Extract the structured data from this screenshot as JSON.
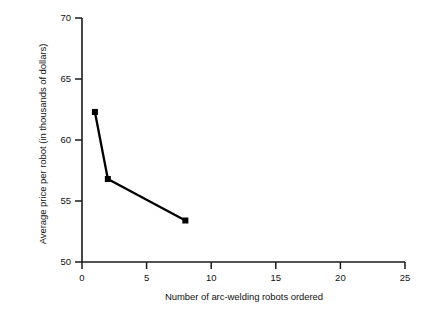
{
  "chart_data": {
    "type": "line",
    "title": "",
    "subtitle": "",
    "xlabel": "Number of arc-welding robots ordered",
    "ylabel": "Average price per robot (in thousands of dollars)",
    "xlim": [
      0,
      25
    ],
    "ylim": [
      50,
      70
    ],
    "xticks": [
      0,
      5,
      10,
      15,
      20,
      25
    ],
    "yticks": [
      50,
      55,
      60,
      65,
      70
    ],
    "xtick_labels": [
      "0",
      "5",
      "10",
      "15",
      "20",
      "25"
    ],
    "ytick_labels": [
      "50",
      "55",
      "60",
      "65",
      "70"
    ],
    "grid": false,
    "legend": false,
    "legend_position": "none",
    "marker": "square",
    "marker_color": "#000000",
    "line_color": "#000000",
    "series": [
      {
        "name": "Average price per robot",
        "x": [
          1,
          2,
          8
        ],
        "y": [
          62.3,
          56.8,
          53.4
        ],
        "points": [
          {
            "x": 1,
            "y": 62.3
          },
          {
            "x": 2,
            "y": 56.8
          },
          {
            "x": 8,
            "y": 53.4
          }
        ]
      }
    ]
  },
  "axes": {
    "y_title": "Average price per robot (in thousands of dollars)",
    "x_title": "Number of arc-welding robots ordered",
    "y_labels": [
      "70",
      "65",
      "60",
      "55",
      "50"
    ],
    "x_labels": [
      "0",
      "5",
      "10",
      "15",
      "20",
      "25"
    ]
  }
}
